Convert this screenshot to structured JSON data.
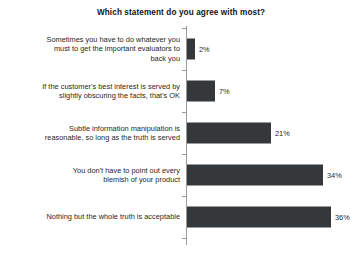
{
  "chart_data": {
    "type": "bar",
    "orientation": "horizontal",
    "title": "Which statement do you agree with most?",
    "xlabel": "",
    "ylabel": "",
    "xlim": [
      0,
      40
    ],
    "grid": false,
    "legend": null,
    "value_suffix": "%",
    "categories": [
      "Sometimes you have to do whatever you\nmust to get the important evaluators to\nback you",
      "If the customer's best interest is served by\nslightly obscuring the facts, that's OK",
      "Subtle information manipulation is\nreasonable, so long as the truth is served",
      "You don't have to point out every\nblemish of your product",
      "Nothing but the whole truth is acceptable"
    ],
    "values": [
      2,
      7,
      21,
      34,
      36
    ],
    "value_labels": [
      "2%",
      "7%",
      "21%",
      "34%",
      "36%"
    ],
    "colors": {
      "bar": "#35383a",
      "axis": "#9a9a9a",
      "text": "#1f1f1f",
      "title": "#141414",
      "background": "#ffffff"
    }
  }
}
